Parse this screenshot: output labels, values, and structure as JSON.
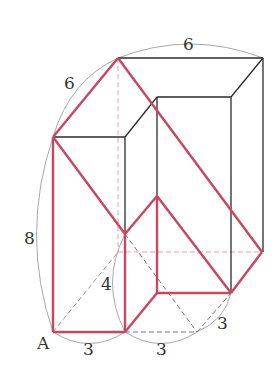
{
  "figure": {
    "type": "3d-solid-net-diagram",
    "colors": {
      "red_edge": "#c8475e",
      "black_edge": "#2a2a2a",
      "dashed_gray": "#888888",
      "dashed_red": "#e3a0ab",
      "arc": "#a0a0a0"
    },
    "labels": {
      "top_width": "6",
      "top_depth": "6",
      "height": "8",
      "inner_height": "4",
      "vertex_A": "A",
      "bottom_left": "3",
      "bottom_mid": "3",
      "bottom_right": "3"
    }
  }
}
